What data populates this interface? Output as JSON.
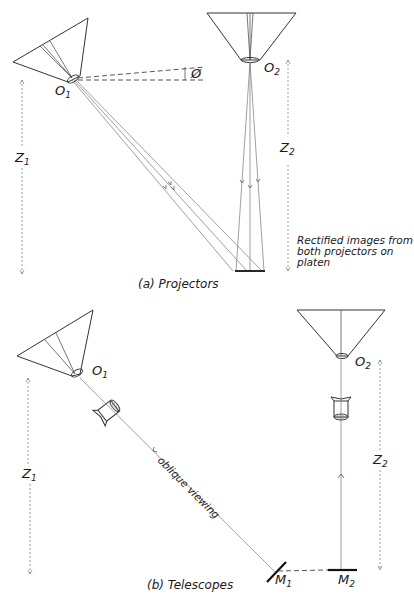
{
  "panel_a": {
    "caption": "(a) Projectors",
    "projector1_label": "O",
    "projector1_sub": "1",
    "projector2_label": "O",
    "projector2_sub": "2",
    "angle_label": "Ø",
    "height1_label": "Z",
    "height1_sub": "1",
    "height2_label": "Z",
    "height2_sub": "2",
    "note_lines": [
      "Rectified images from",
      "both projectors on",
      "platen"
    ]
  },
  "panel_b": {
    "caption": "(b) Telescopes",
    "telescope1_label": "O",
    "telescope1_sub": "1",
    "telescope2_label": "O",
    "telescope2_sub": "2",
    "height1_label": "Z",
    "height1_sub": "1",
    "height2_label": "Z",
    "height2_sub": "2",
    "ray_label": "oblique viewing",
    "mirror1_label": "M",
    "mirror1_sub": "1",
    "mirror2_label": "M",
    "mirror2_sub": "2"
  },
  "colors": {
    "line": "#333333",
    "ray": "#777777",
    "background": "#ffffff"
  }
}
